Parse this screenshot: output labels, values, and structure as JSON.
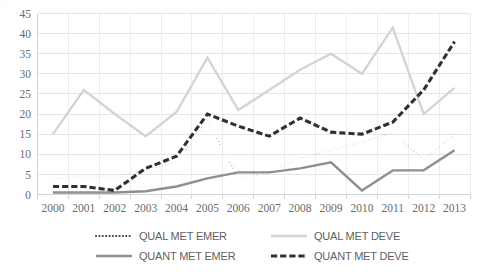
{
  "ghost_text": {
    "fragment": "· ·                 ·                      ·"
  },
  "chart_data": {
    "type": "line",
    "title": "",
    "subtitle": "",
    "xlabel": "",
    "ylabel": "",
    "categories": [
      "2000",
      "2001",
      "2002",
      "2003",
      "2004",
      "2005",
      "2006",
      "2007",
      "2008",
      "2009",
      "2010",
      "2011",
      "2012",
      "2013"
    ],
    "ylim": [
      0,
      45
    ],
    "ytick_values": [
      "0",
      "5",
      "10",
      "15",
      "20",
      "25",
      "30",
      "35",
      "40",
      "45"
    ],
    "ytick_step": 5,
    "grid": true,
    "grid_axis": "y",
    "legend_position": "bottom",
    "series": [
      {
        "name": "QUAL MET EMER",
        "style": "dotted",
        "color": "#3f3f3f",
        "width": 2.1,
        "values": [
          4,
          4.5,
          4.5,
          6,
          8,
          18.5,
          4,
          5.5,
          9,
          11,
          13,
          15.5,
          8.5,
          15
        ]
      },
      {
        "name": "QUAL MET DEVE",
        "style": "solid",
        "color": "#d4d4d4",
        "width": 2.4,
        "values": [
          15,
          26,
          20,
          14.5,
          20.5,
          34,
          21,
          26,
          31,
          35,
          30,
          41.5,
          20,
          26.5
        ]
      },
      {
        "name": "QUANT MET EMER",
        "style": "solid",
        "color": "#8f8f8f",
        "width": 2.4,
        "values": [
          0.5,
          0.5,
          0.5,
          0.8,
          2,
          4,
          5.5,
          5.5,
          6.5,
          8,
          1,
          6,
          6,
          11
        ]
      },
      {
        "name": "QUANT MET DEVE",
        "style": "dashed",
        "color": "#303030",
        "width": 3.1,
        "values": [
          2,
          2,
          1,
          6.5,
          9.5,
          20,
          17,
          14.5,
          19,
          15.5,
          15,
          18,
          26,
          38
        ]
      }
    ]
  }
}
